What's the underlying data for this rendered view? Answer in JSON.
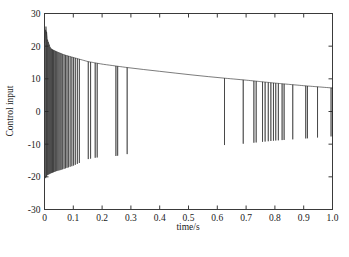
{
  "chart_data": {
    "type": "line",
    "title": "",
    "xlabel": "time/s",
    "ylabel": "Control input",
    "xlim": [
      0,
      1.0
    ],
    "ylim": [
      -30,
      30
    ],
    "grid": false,
    "legend": null,
    "xticks": [
      0,
      0.1,
      0.2,
      0.3,
      0.4,
      0.5,
      0.6,
      0.7,
      0.8,
      0.9,
      1.0
    ],
    "xticklabels": [
      "0",
      "0.1",
      "0.2",
      "0.3",
      "0.4",
      "0.5",
      "0.6",
      "0.7",
      "0.8",
      "0.9",
      "1.0"
    ],
    "yticks": [
      -30,
      -20,
      -10,
      0,
      10,
      20,
      30
    ],
    "yticklabels": [
      "-30",
      "-20",
      "-10",
      "0",
      "10",
      "20",
      "30"
    ],
    "series": [
      {
        "name": "Control input",
        "color": "#2b2b2b",
        "description": "Sliding-mode control signal: decaying upper envelope from about 26 at t=0 down to about 7 at t=1.0, with downward chattering spikes to a decaying lower envelope from about -21 near t=0 to about -8 near t=1.0. Chattering is dense for t<0.13, sparse and isolated afterwards.",
        "upper_envelope": [
          [
            0.0,
            21.0
          ],
          [
            0.005,
            26.0
          ],
          [
            0.01,
            22.0
          ],
          [
            0.02,
            19.4
          ],
          [
            0.03,
            18.8
          ],
          [
            0.05,
            18.0
          ],
          [
            0.07,
            17.3
          ],
          [
            0.09,
            16.8
          ],
          [
            0.11,
            16.3
          ],
          [
            0.15,
            15.3
          ],
          [
            0.2,
            14.5
          ],
          [
            0.25,
            13.9
          ],
          [
            0.3,
            13.3
          ],
          [
            0.4,
            12.3
          ],
          [
            0.5,
            11.3
          ],
          [
            0.6,
            10.4
          ],
          [
            0.7,
            9.6
          ],
          [
            0.8,
            8.7
          ],
          [
            0.9,
            7.9
          ],
          [
            1.0,
            7.2
          ]
        ],
        "lower_envelope": [
          [
            0.0,
            -21.0
          ],
          [
            0.01,
            -19.5
          ],
          [
            0.02,
            -19.0
          ],
          [
            0.04,
            -18.3
          ],
          [
            0.06,
            -17.8
          ],
          [
            0.08,
            -17.2
          ],
          [
            0.1,
            -16.6
          ],
          [
            0.12,
            -15.8
          ],
          [
            0.15,
            -14.6
          ],
          [
            0.18,
            -14.1
          ],
          [
            0.25,
            -13.6
          ],
          [
            0.29,
            -13.0
          ],
          [
            0.62,
            -10.3
          ],
          [
            0.7,
            -9.8
          ],
          [
            0.8,
            -8.9
          ],
          [
            0.9,
            -8.3
          ],
          [
            1.0,
            -7.6
          ]
        ],
        "spike_times": [
          0.004,
          0.007,
          0.01,
          0.013,
          0.016,
          0.019,
          0.022,
          0.025,
          0.028,
          0.031,
          0.034,
          0.038,
          0.042,
          0.046,
          0.05,
          0.054,
          0.058,
          0.063,
          0.068,
          0.073,
          0.078,
          0.083,
          0.089,
          0.095,
          0.101,
          0.107,
          0.114,
          0.121,
          0.152,
          0.16,
          0.176,
          0.183,
          0.248,
          0.254,
          0.287,
          0.625,
          0.69,
          0.727,
          0.735,
          0.757,
          0.766,
          0.777,
          0.786,
          0.795,
          0.803,
          0.812,
          0.825,
          0.832,
          0.862,
          0.907,
          0.913,
          0.948,
          0.995
        ]
      }
    ]
  },
  "axes": {
    "xlabel": "time/s",
    "ylabel": "Control input"
  },
  "caption": {
    "text": ""
  }
}
